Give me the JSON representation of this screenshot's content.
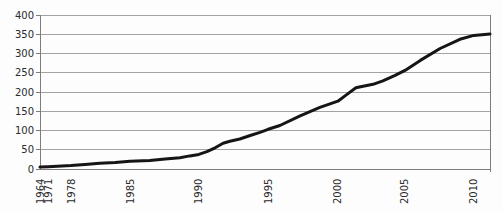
{
  "chart_data": {
    "type": "line",
    "title": "",
    "xlabel": "",
    "ylabel": "",
    "ylim": [
      0,
      400
    ],
    "yticks": [
      0,
      50,
      100,
      150,
      200,
      250,
      300,
      350,
      400
    ],
    "x_tick_labels": [
      "1964",
      "1971",
      "1978",
      "1985",
      "1990",
      "1995",
      "2000",
      "2005",
      "2010"
    ],
    "x_tick_positions_frac": [
      0.0,
      0.018,
      0.069,
      0.2,
      0.353,
      0.507,
      0.662,
      0.811,
      0.964
    ],
    "grid": true,
    "legend_position": "none",
    "line_color": "#151515",
    "line_width": 3,
    "grid_color": "#a2a2a2",
    "axis_color": "#7d7d7d",
    "label_color": "#2b2b2b",
    "plot_background": "#fdfdfd",
    "series": [
      {
        "name": "cumulative-count",
        "points": [
          [
            0.0,
            5
          ],
          [
            0.018,
            6
          ],
          [
            0.069,
            9
          ],
          [
            0.1,
            12
          ],
          [
            0.133,
            15
          ],
          [
            0.167,
            17
          ],
          [
            0.2,
            20
          ],
          [
            0.244,
            22
          ],
          [
            0.278,
            26
          ],
          [
            0.311,
            29
          ],
          [
            0.333,
            34
          ],
          [
            0.353,
            38
          ],
          [
            0.371,
            45
          ],
          [
            0.389,
            55
          ],
          [
            0.407,
            67
          ],
          [
            0.422,
            72
          ],
          [
            0.444,
            78
          ],
          [
            0.467,
            87
          ],
          [
            0.489,
            95
          ],
          [
            0.507,
            103
          ],
          [
            0.533,
            113
          ],
          [
            0.578,
            138
          ],
          [
            0.622,
            160
          ],
          [
            0.662,
            176
          ],
          [
            0.68,
            192
          ],
          [
            0.702,
            211
          ],
          [
            0.718,
            215
          ],
          [
            0.74,
            220
          ],
          [
            0.762,
            229
          ],
          [
            0.789,
            243
          ],
          [
            0.811,
            256
          ],
          [
            0.845,
            282
          ],
          [
            0.889,
            313
          ],
          [
            0.933,
            337
          ],
          [
            0.964,
            347
          ],
          [
            1.0,
            351
          ]
        ]
      }
    ]
  }
}
